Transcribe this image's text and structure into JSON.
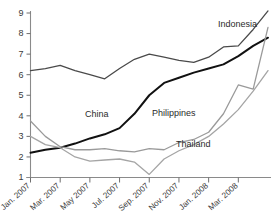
{
  "chart_data": {
    "type": "line",
    "title": "",
    "xlabel": "",
    "ylabel": "",
    "ylim": [
      1,
      9
    ],
    "yticks": [
      1,
      2,
      3,
      4,
      5,
      6,
      7,
      8,
      9
    ],
    "grid": false,
    "legend": "inline-labels",
    "x": [
      "Jan. 2007",
      "Feb. 2007",
      "Mar. 2007",
      "Apr. 2007",
      "May 2007",
      "Jun. 2007",
      "Jul. 2007",
      "Aug. 2007",
      "Sep. 2007",
      "Oct. 2007",
      "Nov. 2007",
      "Dec. 2007",
      "Jan. 2008",
      "Feb. 2008",
      "Mar. 2008",
      "Apr. 2008",
      "May 2008"
    ],
    "xtick_labels": [
      "Jan. 2007",
      "Mar. 2007",
      "May 2007",
      "Jul. 2007",
      "Sep. 2007",
      "Nov. 2007",
      "Jan. 2008",
      "Mar. 2008"
    ],
    "series": [
      {
        "name": "Indonesia",
        "color": "#4a4a4a",
        "width": 1.3,
        "label_x": 218,
        "label_y": 27,
        "values": [
          6.2,
          6.3,
          6.45,
          6.2,
          6.0,
          5.8,
          6.3,
          6.75,
          7.0,
          6.85,
          6.7,
          6.6,
          6.85,
          7.35,
          7.4,
          8.2,
          9.1
        ]
      },
      {
        "name": "China",
        "color": "#111111",
        "width": 2.0,
        "label_x": 85,
        "label_y": 117,
        "values": [
          2.2,
          2.35,
          2.45,
          2.65,
          2.9,
          3.1,
          3.4,
          4.1,
          5.0,
          5.6,
          5.85,
          6.1,
          6.3,
          6.5,
          6.9,
          7.4,
          7.8
        ]
      },
      {
        "name": "Philippines",
        "color": "#9a9a9a",
        "width": 1.3,
        "label_x": 152,
        "label_y": 116,
        "values": [
          3.75,
          3.0,
          2.5,
          2.35,
          2.35,
          2.4,
          2.3,
          2.25,
          2.4,
          2.35,
          2.7,
          2.85,
          3.2,
          4.1,
          5.5,
          5.3,
          8.3
        ]
      },
      {
        "name": "Thailand",
        "color": "#a5a5a5",
        "width": 1.3,
        "label_x": 176,
        "label_y": 147,
        "values": [
          3.0,
          2.6,
          2.45,
          2.0,
          1.8,
          1.85,
          1.9,
          1.75,
          1.15,
          1.9,
          2.3,
          2.6,
          3.0,
          3.6,
          4.3,
          5.2,
          6.2
        ]
      }
    ]
  }
}
